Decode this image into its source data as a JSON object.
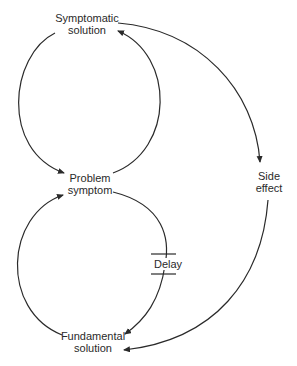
{
  "diagram": {
    "type": "causal-loop",
    "nodes": {
      "symptomatic_solution": {
        "line1": "Symptomatic",
        "line2": "solution"
      },
      "problem_symptom": {
        "line1": "Problem",
        "line2": "symptom"
      },
      "fundamental_solution": {
        "line1": "Fundamental",
        "line2": "solution"
      },
      "side_effect": {
        "line1": "Side",
        "line2": "effect"
      }
    },
    "delay": {
      "label": "Delay"
    },
    "edges": [
      {
        "from": "Symptomatic solution",
        "to": "Problem symptom"
      },
      {
        "from": "Problem symptom",
        "to": "Symptomatic solution"
      },
      {
        "from": "Fundamental solution",
        "to": "Problem symptom"
      },
      {
        "from": "Problem symptom",
        "to": "Fundamental solution",
        "delay": true
      },
      {
        "from": "Symptomatic solution",
        "to": "Side effect"
      },
      {
        "from": "Side effect",
        "to": "Fundamental solution"
      }
    ],
    "colors": {
      "line": "#2a2a2a",
      "text": "#2a2a2a",
      "background": "#ffffff"
    }
  }
}
